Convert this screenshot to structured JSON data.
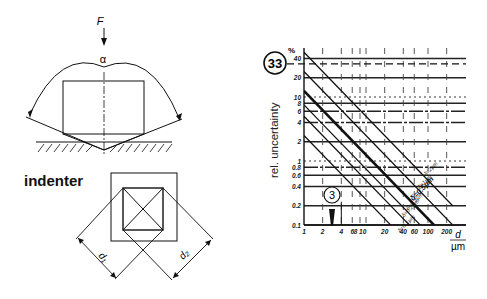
{
  "left_figure": {
    "force_label": "F",
    "angle_label": "α",
    "indenter_label": "indenter",
    "diag1_label": "d₁",
    "diag2_label": "d₂"
  },
  "chart_data": {
    "type": "line",
    "title": "",
    "figure_number": "33",
    "callout_number": "3",
    "xlabel": "d",
    "xunit": "µm",
    "ylabel": "rel. uncertainty",
    "yunit": "%",
    "xscale": "log",
    "yscale": "log",
    "xlim": [
      1,
      300
    ],
    "ylim": [
      0.1,
      40
    ],
    "x_ticks": [
      1,
      2,
      4,
      6,
      8,
      10,
      20,
      40,
      60,
      100,
      200
    ],
    "x_tick_labels": [
      "1",
      "2",
      "4",
      "6",
      "8 10",
      "",
      "20",
      "40",
      "60",
      "100",
      "200"
    ],
    "y_ticks": [
      40,
      20,
      10,
      8,
      6,
      4,
      2,
      1,
      0.8,
      0.6,
      0.4,
      0.2,
      0.1
    ],
    "y_tick_labels": [
      "40",
      "20",
      "10",
      "8",
      "6",
      "4",
      "2",
      "1",
      "0.8",
      "0.6",
      "0.4",
      "0.2",
      "0.1"
    ],
    "grid": true,
    "series": [
      {
        "name": "δ = 0.1 µm",
        "label": "δ=0.1µm",
        "points": [
          [
            1,
            2.5
          ],
          [
            250,
            0.01
          ]
        ],
        "emphasis": false
      },
      {
        "name": "δ = 0.2 µm",
        "label": "δ=0.2µm",
        "points": [
          [
            1,
            5
          ],
          [
            250,
            0.02
          ]
        ],
        "emphasis": false
      },
      {
        "name": "δ = 0.3 µm",
        "label": "δ=0.3µm",
        "points": [
          [
            1,
            7.5
          ],
          [
            250,
            0.03
          ]
        ],
        "emphasis": false
      },
      {
        "name": "δ = 0.5 µm",
        "label": "δ=0.5µm",
        "points": [
          [
            1,
            12.5
          ],
          [
            250,
            0.05
          ]
        ],
        "emphasis": true
      },
      {
        "name": "δ = 1 µm",
        "label": "δ=1µm",
        "points": [
          [
            1,
            25
          ],
          [
            250,
            0.1
          ]
        ],
        "emphasis": false
      },
      {
        "name": "δ = 2 µm",
        "label": "δ=2µm",
        "points": [
          [
            1,
            50
          ],
          [
            250,
            0.2
          ]
        ],
        "emphasis": false
      }
    ],
    "marker": {
      "x": 3,
      "y_top": 0.2,
      "note": "arrow pointing down at d ≈ 3 µm"
    },
    "reference_line": {
      "y": 33,
      "style": "dashed",
      "note": "dashed line from circled 33 to y-axis"
    }
  }
}
